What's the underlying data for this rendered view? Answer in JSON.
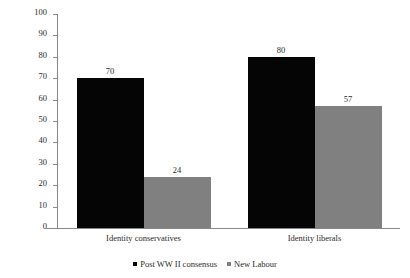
{
  "chart_data": {
    "type": "bar",
    "title": "",
    "subtitle": "",
    "xlabel": "",
    "ylabel": "Percentage of partisans",
    "ylim": [
      0,
      100
    ],
    "ytick_step": 10,
    "yticks": [
      100,
      90,
      80,
      70,
      60,
      50,
      40,
      30,
      20,
      10,
      0
    ],
    "categories": [
      "Identity conservatives",
      "Identity liberals"
    ],
    "grid": false,
    "legend_position": "bottom-center",
    "series": [
      {
        "name": "Post WW II consensus",
        "color": "#050505",
        "values": [
          70,
          80
        ],
        "labels": [
          "70",
          "80"
        ]
      },
      {
        "name": "New Labour",
        "color": "#808080",
        "values": [
          24,
          57
        ],
        "labels": [
          "24",
          "57"
        ]
      }
    ]
  },
  "axes": {
    "y_title": "Percentage of partisans",
    "axis_color": "#8a8a8a"
  },
  "legend": {
    "items": [
      {
        "label": "Post WW II consensus",
        "color": "#050505",
        "marker": "square-marker"
      },
      {
        "label": "New Labour",
        "color": "#808080",
        "marker": "square-marker"
      }
    ]
  }
}
